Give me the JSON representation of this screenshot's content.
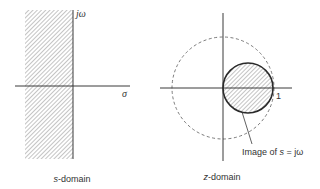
{
  "s_domain": {
    "caption": "s-domain",
    "caption_prefix": "s",
    "caption_suffix": "-domain",
    "axis_imag_label": "jω",
    "axis_real_label": "σ",
    "shaded_region": "left half-plane (σ < 0)"
  },
  "z_domain": {
    "caption": "z-domain",
    "caption_prefix": "z",
    "caption_suffix": "-domain",
    "unit_label": "1",
    "annotation": "Image of s = jω",
    "annotation_prefix": "Image of ",
    "annotation_var": "s",
    "annotation_suffix": " = jω",
    "unit_circle": "dashed",
    "image_circle": "solid, shaded interior"
  },
  "colors": {
    "line": "#3a3a3a",
    "hatch": "#8a8a8a",
    "text": "#333333"
  }
}
